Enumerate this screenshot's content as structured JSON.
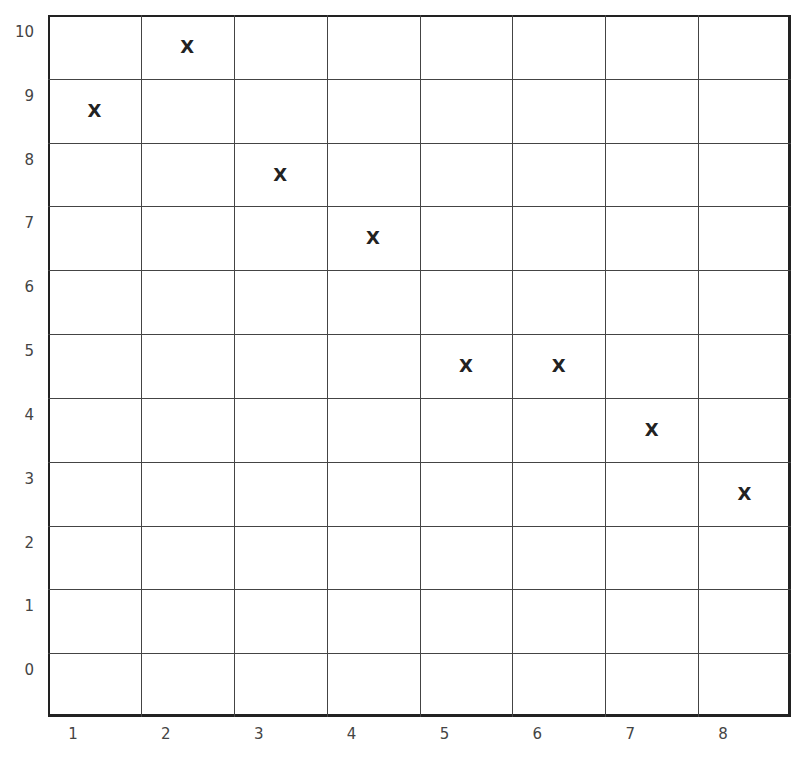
{
  "chart_data": {
    "type": "scatter",
    "title": "",
    "xlabel": "",
    "ylabel": "",
    "marker": "x",
    "x_ticks": [
      "1",
      "2",
      "3",
      "4",
      "5",
      "6",
      "7",
      "8"
    ],
    "y_ticks": [
      "10",
      "9",
      "8",
      "7",
      "6",
      "5",
      "4",
      "3",
      "2",
      "1",
      "0"
    ],
    "grid": true,
    "xlim": [
      1,
      9
    ],
    "ylim": [
      -1,
      10
    ],
    "points": [
      {
        "x": 1,
        "y": 8.5
      },
      {
        "x": 2,
        "y": 9.5
      },
      {
        "x": 3,
        "y": 7.5
      },
      {
        "x": 4,
        "y": 6.5
      },
      {
        "x": 5,
        "y": 4.5
      },
      {
        "x": 6,
        "y": 4.5
      },
      {
        "x": 7,
        "y": 3.5
      },
      {
        "x": 8,
        "y": 2.5
      }
    ]
  },
  "marker_glyph": "X"
}
